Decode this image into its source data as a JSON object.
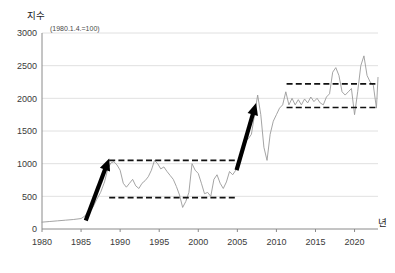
{
  "chart_data": {
    "type": "line",
    "title": "지수",
    "subtitle": "(1980.1.4.=100)",
    "xlabel": "년",
    "ylabel": "지수",
    "xlim": [
      1980,
      2023
    ],
    "ylim": [
      0,
      3000
    ],
    "ytick_labels": [
      "0",
      "500",
      "1000",
      "1500",
      "2000",
      "2500",
      "3000"
    ],
    "yticks": [
      0,
      500,
      1000,
      1500,
      2000,
      2500,
      3000
    ],
    "xtick_labels": [
      "1980",
      "1985",
      "1990",
      "1995",
      "2000",
      "2005",
      "2010",
      "2015",
      "2020"
    ],
    "xticks": [
      1980,
      1985,
      1990,
      1995,
      2000,
      2005,
      2010,
      2015,
      2020
    ],
    "grid": "horizontal",
    "legend": "none",
    "line_color": "#9a9a9a",
    "annotation_color": "#000000",
    "series": [
      {
        "name": "지수",
        "x": [
          1980.0,
          1981.0,
          1982.0,
          1983.0,
          1984.0,
          1985.0,
          1985.5,
          1986.0,
          1986.5,
          1987.0,
          1987.5,
          1988.0,
          1988.4,
          1988.8,
          1989.2,
          1989.6,
          1990.0,
          1990.4,
          1990.8,
          1991.2,
          1991.6,
          1992.0,
          1992.4,
          1992.8,
          1993.2,
          1993.6,
          1994.0,
          1994.4,
          1994.8,
          1995.2,
          1995.6,
          1996.0,
          1996.4,
          1996.8,
          1997.2,
          1997.6,
          1998.0,
          1998.4,
          1998.8,
          1999.2,
          1999.6,
          2000.0,
          2000.4,
          2000.8,
          2001.2,
          2001.6,
          2002.0,
          2002.4,
          2002.8,
          2003.2,
          2003.6,
          2004.0,
          2004.4,
          2004.8,
          2005.2,
          2005.6,
          2006.0,
          2006.4,
          2006.8,
          2007.2,
          2007.6,
          2008.0,
          2008.4,
          2008.8,
          2009.2,
          2009.6,
          2010.0,
          2010.4,
          2010.8,
          2011.2,
          2011.6,
          2012.0,
          2012.4,
          2012.8,
          2013.2,
          2013.6,
          2014.0,
          2014.4,
          2014.8,
          2015.2,
          2015.6,
          2016.0,
          2016.4,
          2016.8,
          2017.2,
          2017.6,
          2018.0,
          2018.4,
          2018.8,
          2019.2,
          2019.6,
          2020.0,
          2020.4,
          2020.8,
          2021.2,
          2021.6,
          2022.0,
          2022.4,
          2022.8,
          2023.0
        ],
        "values": [
          105,
          115,
          125,
          135,
          145,
          160,
          200,
          275,
          330,
          450,
          560,
          720,
          910,
          1010,
          1030,
          980,
          900,
          700,
          640,
          700,
          760,
          660,
          620,
          700,
          740,
          800,
          900,
          1050,
          1000,
          920,
          950,
          880,
          820,
          760,
          650,
          520,
          330,
          420,
          560,
          1000,
          900,
          850,
          700,
          540,
          560,
          500,
          760,
          830,
          700,
          620,
          720,
          880,
          830,
          900,
          1010,
          1150,
          1350,
          1380,
          1450,
          1750,
          2050,
          1750,
          1250,
          1050,
          1450,
          1650,
          1750,
          1850,
          1900,
          2100,
          1900,
          2000,
          1900,
          1980,
          1900,
          1990,
          1930,
          2020,
          1950,
          2000,
          1930,
          1900,
          2020,
          2070,
          2400,
          2470,
          2350,
          2100,
          2050,
          2100,
          2150,
          1750,
          2100,
          2500,
          2650,
          2350,
          2250,
          2200,
          1850,
          2320
        ]
      }
    ],
    "annotations": {
      "bands": [
        {
          "name": "first-range-band",
          "top_value": 1050,
          "bottom_value": 480,
          "x_start": 1988.6,
          "x_end": 2005.0
        },
        {
          "name": "second-range-band",
          "top_value": 2220,
          "bottom_value": 1860,
          "x_start": 2011.3,
          "x_end": 2023.0
        }
      ],
      "arrows": [
        {
          "name": "first-rally-arrow",
          "x_start": 1985.6,
          "y_start": 130,
          "x_end": 1988.6,
          "y_end": 1080
        },
        {
          "name": "second-rally-arrow",
          "x_start": 2004.9,
          "y_start": 900,
          "x_end": 2007.4,
          "y_end": 1930
        }
      ]
    }
  }
}
